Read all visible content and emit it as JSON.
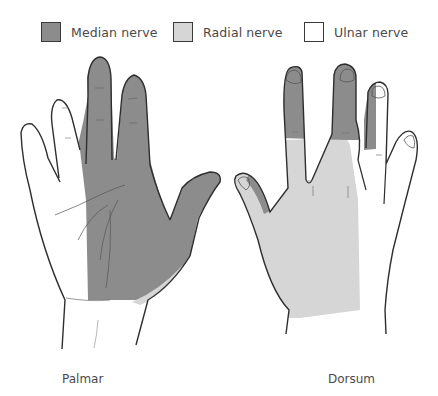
{
  "legend": {
    "items": [
      {
        "label": "Median nerve",
        "color": "#8c8c8c"
      },
      {
        "label": "Radial nerve",
        "color": "#d6d6d6"
      },
      {
        "label": "Ulnar nerve",
        "color": "#ffffff"
      }
    ]
  },
  "figures": {
    "palmar": {
      "caption": "Palmar"
    },
    "dorsum": {
      "caption": "Dorsum"
    }
  },
  "colors": {
    "median": "#8c8c8c",
    "radial": "#d6d6d6",
    "ulnar": "#ffffff",
    "outline": "#2e2e2e"
  }
}
